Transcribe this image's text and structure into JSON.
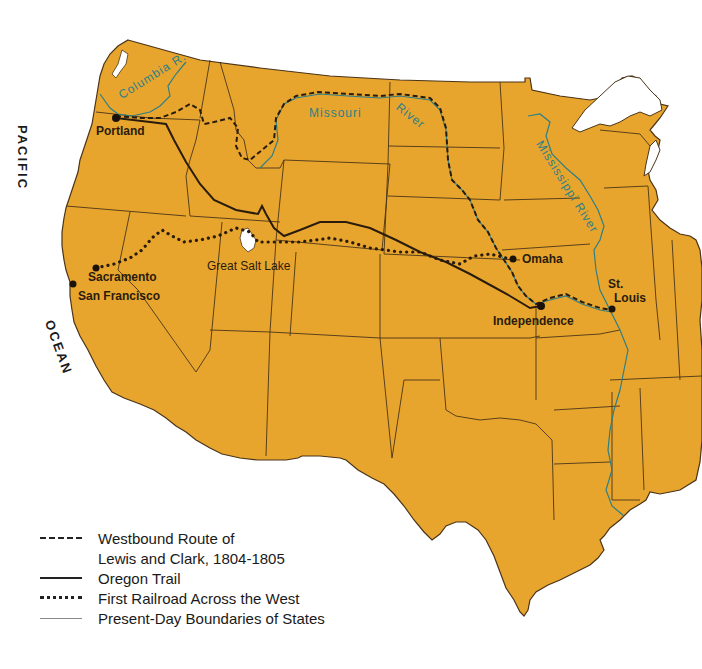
{
  "map": {
    "land_color": "#E8A52E",
    "border_color": "#4a3418",
    "river_color": "#2d7f86",
    "water_color": "#ffffff",
    "ocean_labels": {
      "pacific": "PACIFIC",
      "ocean": "OCEAN"
    },
    "cities": [
      {
        "name": "Portland",
        "x": 116,
        "y": 118
      },
      {
        "name": "Sacramento",
        "x": 96,
        "y": 268
      },
      {
        "name": "San Francisco",
        "x": 73,
        "y": 284
      },
      {
        "name": "Omaha",
        "x": 513,
        "y": 259
      },
      {
        "name": "Independence",
        "x": 541,
        "y": 306
      },
      {
        "name": "St. Louis",
        "x": 612,
        "y": 309
      }
    ],
    "features": {
      "great_salt_lake": "Great Salt Lake"
    },
    "rivers": {
      "columbia": "Columbia R.",
      "missouri_1": "Missouri",
      "missouri_2": "River",
      "mississippi": "Mississippi River"
    }
  },
  "legend": {
    "items": [
      {
        "style": "dashed",
        "label": "Westbound Route of",
        "label2": "Lewis and Clark, 1804-1805"
      },
      {
        "style": "solid",
        "label": "Oregon Trail"
      },
      {
        "style": "dotted",
        "label": "First Railroad Across the West"
      },
      {
        "style": "thin",
        "label": "Present-Day Boundaries of States"
      }
    ]
  }
}
